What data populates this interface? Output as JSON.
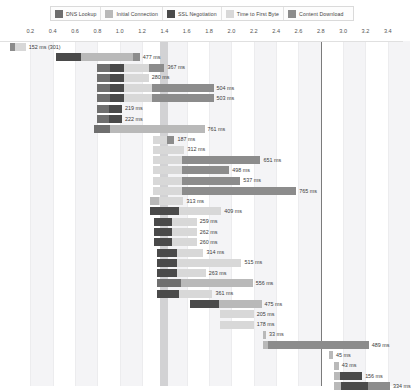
{
  "legend": {
    "items": [
      {
        "label": "DNS Lookup",
        "color": "#6f6f6f",
        "icon": "swatch-icon"
      },
      {
        "label": "Initial Connection",
        "color": "#b9b9b9",
        "icon": "swatch-icon"
      },
      {
        "label": "SSL Negotiation",
        "color": "#4a4a4a",
        "icon": "swatch-icon"
      },
      {
        "label": "Time to First Byte",
        "color": "#d8d8d8",
        "icon": "swatch-icon"
      },
      {
        "label": "Content Download",
        "color": "#8c8c8c",
        "icon": "swatch-icon"
      }
    ]
  },
  "axis": {
    "ticks": [
      "0.2",
      "0.4",
      "0.6",
      "0.8",
      "1.0",
      "1.2",
      "1.4",
      "1.6",
      "1.8",
      "2.0",
      "2.2",
      "2.4",
      "2.6",
      "2.8",
      "3.0",
      "3.2",
      "3.4"
    ],
    "unit": "s",
    "min": 0.0,
    "max": 3.5
  },
  "markers": {
    "soft_band_label": "1.40",
    "hard_line_label": "2.80"
  },
  "chart_data": {
    "type": "bar",
    "title": "",
    "xlabel": "",
    "ylabel": "",
    "orientation": "horizontal-waterfall",
    "xlim": [
      0.0,
      3.5
    ],
    "grid": true,
    "legend_position": "top",
    "series": [
      {
        "name": "DNS Lookup",
        "color": "#6f6f6f"
      },
      {
        "name": "Initial Connection",
        "color": "#b9b9b9"
      },
      {
        "name": "SSL Negotiation",
        "color": "#4a4a4a"
      },
      {
        "name": "Time to First Byte",
        "color": "#d8d8d8"
      },
      {
        "name": "Content Download",
        "color": "#8c8c8c"
      }
    ],
    "requests": [
      {
        "label": "152 ms (301)",
        "start": 0.02,
        "segments": [
          [
            0.04,
            "#8c8c8c"
          ],
          [
            0.1,
            "#d8d8d8"
          ]
        ]
      },
      {
        "label": "477 ms",
        "start": 0.43,
        "segments": [
          [
            0.22,
            "#4a4a4a"
          ],
          [
            0.47,
            "#b9b9b9"
          ],
          [
            0.06,
            "#8c8c8c"
          ]
        ]
      },
      {
        "label": "367 ms",
        "start": 0.8,
        "segments": [
          [
            0.11,
            "#6f6f6f"
          ],
          [
            0.13,
            "#4a4a4a"
          ],
          [
            0.22,
            "#d8d8d8"
          ],
          [
            0.14,
            "#8c8c8c"
          ]
        ]
      },
      {
        "label": "280 ms",
        "start": 0.8,
        "segments": [
          [
            0.11,
            "#6f6f6f"
          ],
          [
            0.13,
            "#4a4a4a"
          ],
          [
            0.22,
            "#d8d8d8"
          ]
        ]
      },
      {
        "label": "504 ms",
        "start": 0.8,
        "segments": [
          [
            0.11,
            "#6f6f6f"
          ],
          [
            0.13,
            "#4a4a4a"
          ],
          [
            0.25,
            "#d8d8d8"
          ],
          [
            0.55,
            "#8c8c8c"
          ]
        ]
      },
      {
        "label": "503 ms",
        "start": 0.8,
        "segments": [
          [
            0.11,
            "#6f6f6f"
          ],
          [
            0.13,
            "#4a4a4a"
          ],
          [
            0.25,
            "#d8d8d8"
          ],
          [
            0.55,
            "#8c8c8c"
          ]
        ]
      },
      {
        "label": "219 ms",
        "start": 0.8,
        "segments": [
          [
            0.1,
            "#6f6f6f"
          ],
          [
            0.12,
            "#4a4a4a"
          ]
        ]
      },
      {
        "label": "222 ms",
        "start": 0.8,
        "segments": [
          [
            0.1,
            "#6f6f6f"
          ],
          [
            0.12,
            "#4a4a4a"
          ]
        ]
      },
      {
        "label": "761 ms",
        "start": 0.77,
        "segments": [
          [
            0.14,
            "#6f6f6f"
          ],
          [
            0.85,
            "#b9b9b9"
          ]
        ]
      },
      {
        "label": "187 ms",
        "start": 1.3,
        "segments": [
          [
            0.12,
            "#d8d8d8"
          ],
          [
            0.07,
            "#8c8c8c"
          ]
        ]
      },
      {
        "label": "312 ms",
        "start": 1.3,
        "segments": [
          [
            0.28,
            "#d8d8d8"
          ]
        ]
      },
      {
        "label": "651 ms",
        "start": 1.3,
        "segments": [
          [
            0.26,
            "#d8d8d8"
          ],
          [
            0.7,
            "#8c8c8c"
          ]
        ]
      },
      {
        "label": "498 ms",
        "start": 1.3,
        "segments": [
          [
            0.26,
            "#d8d8d8"
          ],
          [
            0.42,
            "#8c8c8c"
          ]
        ]
      },
      {
        "label": "537 ms",
        "start": 1.3,
        "segments": [
          [
            0.26,
            "#d8d8d8"
          ],
          [
            0.52,
            "#8c8c8c"
          ]
        ]
      },
      {
        "label": "765 ms",
        "start": 1.3,
        "segments": [
          [
            0.26,
            "#d8d8d8"
          ],
          [
            1.02,
            "#8c8c8c"
          ]
        ]
      },
      {
        "label": "313 ms",
        "start": 1.27,
        "segments": [
          [
            0.08,
            "#b9b9b9"
          ],
          [
            0.22,
            "#d8d8d8"
          ]
        ]
      },
      {
        "label": "409 ms",
        "start": 1.27,
        "segments": [
          [
            0.26,
            "#4a4a4a"
          ],
          [
            0.38,
            "#d8d8d8"
          ]
        ]
      },
      {
        "label": "259 ms",
        "start": 1.31,
        "segments": [
          [
            0.16,
            "#4a4a4a"
          ],
          [
            0.22,
            "#d8d8d8"
          ]
        ]
      },
      {
        "label": "262 ms",
        "start": 1.31,
        "segments": [
          [
            0.16,
            "#4a4a4a"
          ],
          [
            0.22,
            "#d8d8d8"
          ]
        ]
      },
      {
        "label": "260 ms",
        "start": 1.31,
        "segments": [
          [
            0.16,
            "#4a4a4a"
          ],
          [
            0.22,
            "#d8d8d8"
          ]
        ]
      },
      {
        "label": "314 ms",
        "start": 1.33,
        "segments": [
          [
            0.18,
            "#4a4a4a"
          ],
          [
            0.24,
            "#d8d8d8"
          ]
        ]
      },
      {
        "label": "515 ms",
        "start": 1.33,
        "segments": [
          [
            0.18,
            "#4a4a4a"
          ],
          [
            0.58,
            "#d8d8d8"
          ]
        ]
      },
      {
        "label": "263 ms",
        "start": 1.33,
        "segments": [
          [
            0.18,
            "#4a4a4a"
          ],
          [
            0.26,
            "#d8d8d8"
          ]
        ]
      },
      {
        "label": "556 ms",
        "start": 1.33,
        "segments": [
          [
            0.22,
            "#6f6f6f"
          ],
          [
            0.64,
            "#b9b9b9"
          ]
        ]
      },
      {
        "label": "361 ms",
        "start": 1.33,
        "segments": [
          [
            0.2,
            "#4a4a4a"
          ],
          [
            0.3,
            "#d8d8d8"
          ]
        ]
      },
      {
        "label": "475 ms",
        "start": 1.63,
        "segments": [
          [
            0.26,
            "#4a4a4a"
          ],
          [
            0.38,
            "#b9b9b9"
          ]
        ]
      },
      {
        "label": "205 ms",
        "start": 1.9,
        "segments": [
          [
            0.3,
            "#d8d8d8"
          ]
        ]
      },
      {
        "label": "178 ms",
        "start": 1.9,
        "segments": [
          [
            0.3,
            "#d8d8d8"
          ]
        ]
      },
      {
        "label": "33 ms",
        "start": 2.28,
        "segments": [
          [
            0.03,
            "#b9b9b9"
          ]
        ]
      },
      {
        "label": "489 ms",
        "start": 2.28,
        "segments": [
          [
            0.05,
            "#b9b9b9"
          ],
          [
            0.9,
            "#8c8c8c"
          ]
        ]
      },
      {
        "label": "45 ms",
        "start": 2.87,
        "segments": [
          [
            0.04,
            "#b9b9b9"
          ]
        ]
      },
      {
        "label": "43 ms",
        "start": 2.92,
        "segments": [
          [
            0.04,
            "#b9b9b9"
          ]
        ]
      },
      {
        "label": "156 ms",
        "start": 2.92,
        "segments": [
          [
            0.05,
            "#b9b9b9"
          ],
          [
            0.2,
            "#4a4a4a"
          ]
        ]
      },
      {
        "label": "334 ms",
        "start": 2.92,
        "segments": [
          [
            0.06,
            "#b9b9b9"
          ],
          [
            0.24,
            "#4a4a4a"
          ],
          [
            0.2,
            "#8c8c8c"
          ]
        ]
      }
    ]
  }
}
